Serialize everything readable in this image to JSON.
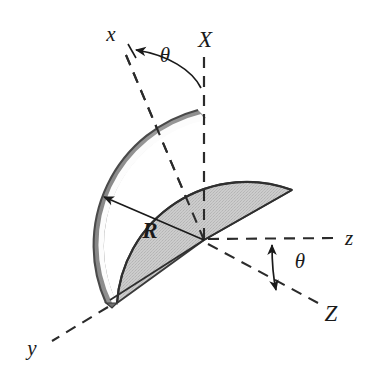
{
  "labels": {
    "x_axis": "x",
    "y_axis": "y",
    "z_axis": "z",
    "X_axis": "X",
    "Z_axis": "Z",
    "theta_upper": "θ",
    "theta_lower": "θ",
    "radius": "R"
  },
  "colors": {
    "stroke": "#1a1a1a",
    "dash": "#2b2b2b",
    "disk_face": "#c9c9c9",
    "disk_rim_dark": "#8d8d8d",
    "disk_rim_highlight": "#fbfbfb",
    "disk_outline": "#3a3a3a",
    "background": "#ffffff"
  },
  "geometry": {
    "origin": {
      "x": 204,
      "y": 240
    },
    "radius_px": 140,
    "x_axis_end": {
      "x": 120,
      "y": 47
    },
    "X_axis_end": {
      "x": 204,
      "y": 52
    },
    "y_axis_end": {
      "x": 48,
      "y": 338
    },
    "z_axis_end": {
      "x": 338,
      "y": 238
    },
    "Z_axis_end": {
      "x": 318,
      "y": 303
    },
    "disk_left_tip": {
      "x": 106,
      "y": 303
    },
    "disk_right_tip": {
      "x": 292,
      "y": 190
    },
    "disk_apex": {
      "x": 198,
      "y": 110
    },
    "radius_arrow_from": {
      "x": 166,
      "y": 230
    },
    "radius_arrow_to": {
      "x": 104,
      "y": 197
    }
  },
  "annotations": {
    "theta_upper_position": {
      "x": 163,
      "y": 57
    },
    "theta_lower_position": {
      "x": 298,
      "y": 261
    },
    "radius_label_position": {
      "x": 150,
      "y": 230
    },
    "x_label_position": {
      "x": 111,
      "y": 38
    },
    "X_label_position": {
      "x": 204,
      "y": 44
    },
    "y_label_position": {
      "x": 32,
      "y": 351
    },
    "z_label_position": {
      "x": 348,
      "y": 240
    },
    "Z_label_position": {
      "x": 330,
      "y": 316
    }
  }
}
